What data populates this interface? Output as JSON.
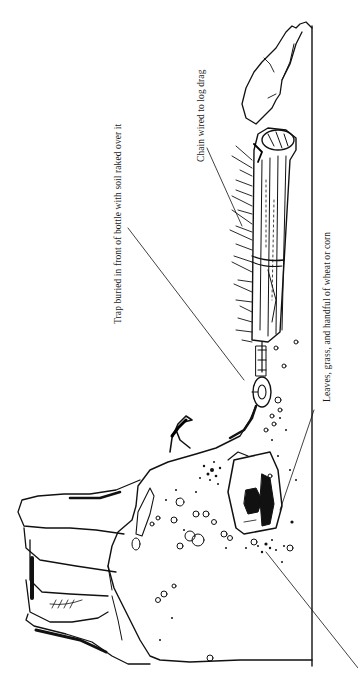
{
  "figure": {
    "orientation": "rotated-90-counterclockwise",
    "labels": {
      "trap": "Trap buried in front of bottle with soil raked over it",
      "chain": "Chain wired to log drag",
      "bait": "Leaves, grass, and handful of wheat or corn"
    },
    "elements": [
      "stump",
      "log-drag",
      "chain",
      "trap",
      "bottle",
      "ground-line",
      "soil-mound",
      "grass-tufts"
    ],
    "colors": {
      "ink": "#111111",
      "paper": "#ffffff"
    }
  }
}
